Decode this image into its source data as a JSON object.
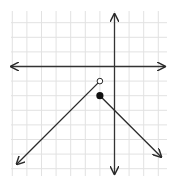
{
  "chart_data": {
    "type": "line",
    "title": "",
    "xlabel": "",
    "ylabel": "",
    "grid": true,
    "xlim": [
      -7,
      3.5
    ],
    "ylim": [
      -7.5,
      3.8
    ],
    "origin_px": [
      114.5,
      66.5
    ],
    "unit_px": 14.6,
    "series": [
      {
        "name": "left-branch",
        "equation": "y = x",
        "domain": "x < -1",
        "points": [
          [
            -1,
            -1
          ],
          [
            -6.7,
            -6.7
          ]
        ],
        "endpoint": {
          "x": -1,
          "y": -1,
          "style": "open"
        },
        "arrow_end": [
          -6.7,
          -6.7
        ]
      },
      {
        "name": "right-branch",
        "equation": "y = -x - 3",
        "domain": "x >= -1",
        "points": [
          [
            -1,
            -2
          ],
          [
            3.2,
            -6.2
          ]
        ],
        "endpoint": {
          "x": -1,
          "y": -2,
          "style": "closed"
        },
        "arrow_end": [
          3.2,
          -6.2
        ]
      }
    ]
  },
  "colors": {
    "grid": "#e2e2e2",
    "axis": "#333333",
    "line": "#2a2a2a"
  }
}
